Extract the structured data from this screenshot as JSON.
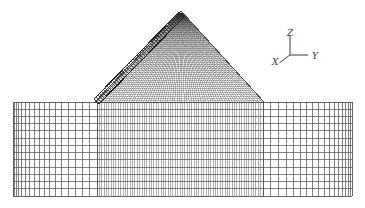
{
  "figure": {
    "kind": "finite-element-mesh",
    "background_color": "#ffffff",
    "line_color": "#4a4a4a",
    "dense_line_color": "#2e2e2e",
    "slab_color": "#1c1c1c",
    "width": 365,
    "height": 208
  },
  "axis_triad": {
    "name": "coordinate-axes",
    "origin": {
      "x": 290,
      "y": 55
    },
    "z_label": "Z",
    "y_label": "Y",
    "x_label": "X",
    "z_label_pos": {
      "x": 287,
      "y": 36
    },
    "y_label_pos": {
      "x": 312,
      "y": 59
    },
    "x_label_pos": {
      "x": 272,
      "y": 65
    },
    "z_arm_length": 20,
    "y_arm_length": 18,
    "x_arm_length": 14
  },
  "foundation": {
    "name": "foundation-mesh",
    "left": 13,
    "right": 352,
    "top": 102,
    "bottom": 196,
    "rows": 13,
    "row_grading": "uniform",
    "left_block": {
      "from": 13,
      "to": 97,
      "columns": 17,
      "grading": "coarse-to-fine (left to right)"
    },
    "right_block": {
      "from": 263,
      "to": 352,
      "columns": 17,
      "grading": "fine-to-coarse (left to right)"
    },
    "center_block": {
      "from": 97,
      "to": 263,
      "columns": 70,
      "grading": "uniform-fine"
    }
  },
  "dam_body": {
    "name": "dam-body-mesh",
    "apex": {
      "x": 181,
      "y": 11
    },
    "left_toe": {
      "x": 95,
      "y": 102
    },
    "right_toe": {
      "x": 264,
      "y": 102
    },
    "upstream_slope_side": "left",
    "downstream_slope_side": "right",
    "columns": 70,
    "rows": 46,
    "mesh_style": "fine-quadrilateral"
  },
  "facing_slab": {
    "name": "upstream-facing-slab",
    "description": "thin hatched band of elements along the upstream (left) face",
    "top": {
      "x": 179,
      "y": 12
    },
    "bottom": {
      "x": 94,
      "y": 99
    },
    "thickness": 7,
    "divisions": 46,
    "hatch": "transverse"
  },
  "chart_data": {
    "type": "mesh",
    "title": "",
    "xlabel": "",
    "ylabel": "",
    "legend": [],
    "annotations": [
      "Z",
      "Y",
      "X"
    ]
  }
}
